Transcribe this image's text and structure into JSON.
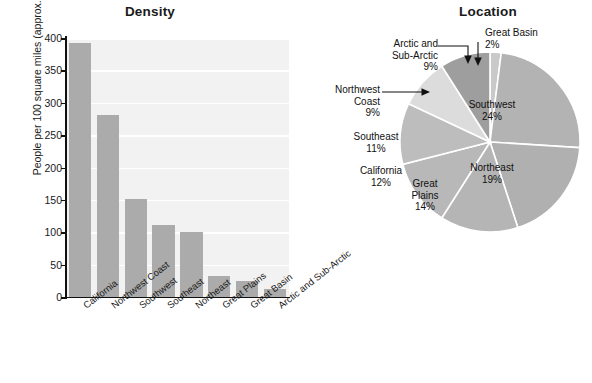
{
  "chart_data": [
    {
      "type": "bar",
      "title": "Density",
      "xlabel": "",
      "ylabel": "People per 100 square miles (approx.)",
      "ylim": [
        0,
        400
      ],
      "yticks": [
        400,
        350,
        300,
        250,
        200,
        150,
        100,
        50,
        0
      ],
      "grid": true,
      "legend": "none",
      "bar_color": "#ababab",
      "plot_background": "#f2f2f2",
      "gridline_color": "#ffffff",
      "categories": [
        "California",
        "Northwest Coast",
        "Southwest",
        "Southeast",
        "Northeast",
        "Great Plains",
        "Great Basin",
        "Arctic and Sub-Arctic"
      ],
      "values": [
        392,
        281,
        151,
        111,
        101,
        33,
        24,
        13
      ]
    },
    {
      "type": "pie",
      "title": "Location",
      "legend": "labels-on-slices",
      "start_angle_deg": 0,
      "direction": "clockwise",
      "labels": [
        "Great Basin",
        "Southwest",
        "Northeast",
        "Great Plains",
        "California",
        "Southeast",
        "Northwest Coast",
        "Arctic and Sub-Arctic"
      ],
      "values": [
        2,
        24,
        19,
        14,
        12,
        11,
        9,
        9
      ],
      "value_suffix": "%",
      "slice_colors": [
        "#c9c9c9",
        "#b3b3b3",
        "#b0b0b0",
        "#b5b5b5",
        "#b8b8b8",
        "#bdbdbd",
        "#dcdcdc",
        "#9e9e9e"
      ],
      "callout_labels": [
        "Great Basin",
        "Arctic and Sub-Arctic",
        "Northwest Coast"
      ],
      "inside_labels": [
        "Southwest",
        "Northeast",
        "Great Plains",
        "California",
        "Southeast"
      ]
    }
  ],
  "bar_chart": {
    "title": "Density",
    "y_axis_label": "People per 100 square miles (approx.)",
    "y_ticks": [
      "400",
      "350",
      "300",
      "250",
      "200",
      "150",
      "100",
      "50",
      "0"
    ],
    "x_tick_labels": [
      "California",
      "Northwest Coast",
      "Southwest",
      "Southeast",
      "Northeast",
      "Great Plains",
      "Great Basin",
      "Arctic and Sub-Arctic"
    ]
  },
  "pie_chart": {
    "title": "Location",
    "slices": [
      {
        "label": "Great Basin",
        "percent": "2%"
      },
      {
        "label": "Southwest",
        "percent": "24%"
      },
      {
        "label": "Northeast",
        "percent": "19%"
      },
      {
        "label": "Great Plains",
        "percent": "14%"
      },
      {
        "label": "California",
        "percent": "12%"
      },
      {
        "label": "Southeast",
        "percent": "11%"
      },
      {
        "label": "Northwest Coast",
        "percent": "9%"
      },
      {
        "label": "Arctic and Sub-Arctic",
        "percent": "9%"
      }
    ],
    "callouts": {
      "great_basin_line1": "Great Basin",
      "great_basin_line2": "2%",
      "arctic_line1": "Arctic and",
      "arctic_line2": "Sub-Arctic",
      "arctic_line3": "9%",
      "northwest_line1": "Northwest",
      "northwest_line2": "Coast",
      "northwest_line3": "9%"
    },
    "inside": {
      "southwest_line1": "Southwest",
      "southwest_line2": "24%",
      "northeast_line1": "Northeast",
      "northeast_line2": "19%",
      "greatplains_line1": "Great",
      "greatplains_line2": "Plains",
      "greatplains_line3": "14%",
      "california_line1": "California",
      "california_line2": "12%",
      "southeast_line1": "Southeast",
      "southeast_line2": "11%"
    }
  }
}
